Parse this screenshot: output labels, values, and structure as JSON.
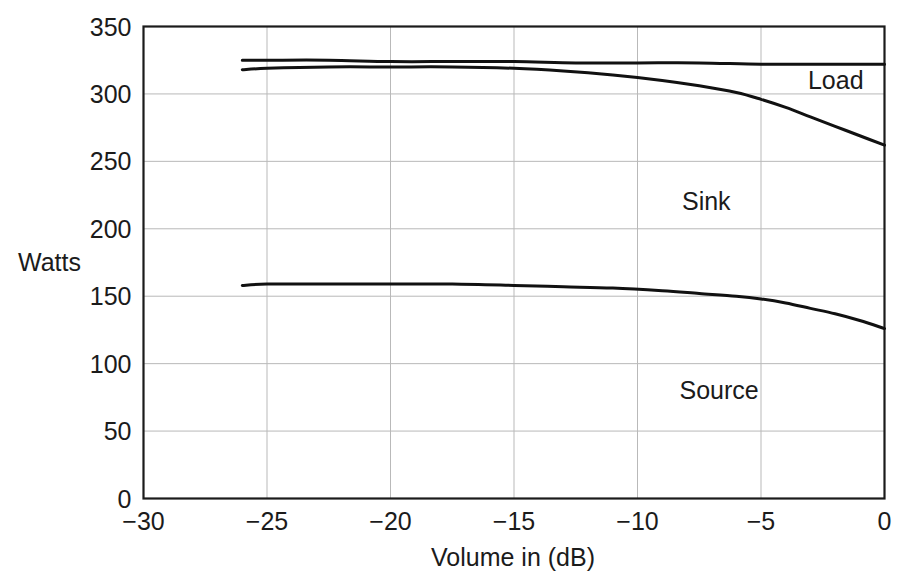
{
  "chart_data": {
    "type": "line",
    "title": "",
    "subtitle": "",
    "xlabel": "Volume in (dB)",
    "ylabel": "Watts",
    "xlim": [
      -30,
      0
    ],
    "ylim": [
      0,
      350
    ],
    "xticks": [
      -30,
      -25,
      -20,
      -15,
      -10,
      -5,
      0
    ],
    "xticklabels": [
      "−30",
      "−25",
      "−20",
      "−15",
      "−10",
      "−5",
      "0"
    ],
    "yticks": [
      0,
      50,
      100,
      150,
      200,
      250,
      300,
      350
    ],
    "yticklabels": [
      "0",
      "50",
      "100",
      "150",
      "200",
      "250",
      "300",
      "350"
    ],
    "grid": true,
    "grid_color": "#b9b9b9",
    "legend": "none",
    "line_color": "#111111",
    "frame_color": "#1b1b1b",
    "series": [
      {
        "name": "Load",
        "x": [
          -26.0,
          -25.0,
          -22.5,
          -20.0,
          -17.5,
          -15.0,
          -12.5,
          -10.0,
          -7.5,
          -5.0,
          -2.5,
          0.0
        ],
        "values": [
          325,
          325,
          325,
          324,
          324,
          324,
          323,
          323,
          323,
          322,
          322,
          322
        ]
      },
      {
        "name": "Sink boundary",
        "x": [
          -26.0,
          -25.0,
          -22.5,
          -20.0,
          -17.5,
          -15.0,
          -13.0,
          -11.0,
          -9.0,
          -7.5,
          -6.0,
          -5.0,
          -4.0,
          -3.0,
          -2.0,
          -1.0,
          0.0
        ],
        "values": [
          318,
          319,
          320,
          320,
          320,
          319,
          317,
          314,
          310,
          306,
          301,
          296,
          290,
          283,
          276,
          269,
          262
        ]
      },
      {
        "name": "Source",
        "x": [
          -26.0,
          -25.0,
          -22.5,
          -20.0,
          -17.5,
          -15.0,
          -13.0,
          -11.0,
          -9.0,
          -7.5,
          -6.0,
          -5.0,
          -4.0,
          -3.0,
          -2.0,
          -1.0,
          0.0
        ],
        "values": [
          158,
          159,
          159,
          159,
          159,
          158,
          157,
          156,
          154,
          152,
          150,
          148,
          145,
          141,
          137,
          132,
          126
        ]
      }
    ],
    "annotations": [
      {
        "text": "Load",
        "x": -3.1,
        "y": 304
      },
      {
        "text": "Sink",
        "x": -8.2,
        "y": 214
      },
      {
        "text": "Source",
        "x": -8.3,
        "y": 74
      }
    ]
  }
}
